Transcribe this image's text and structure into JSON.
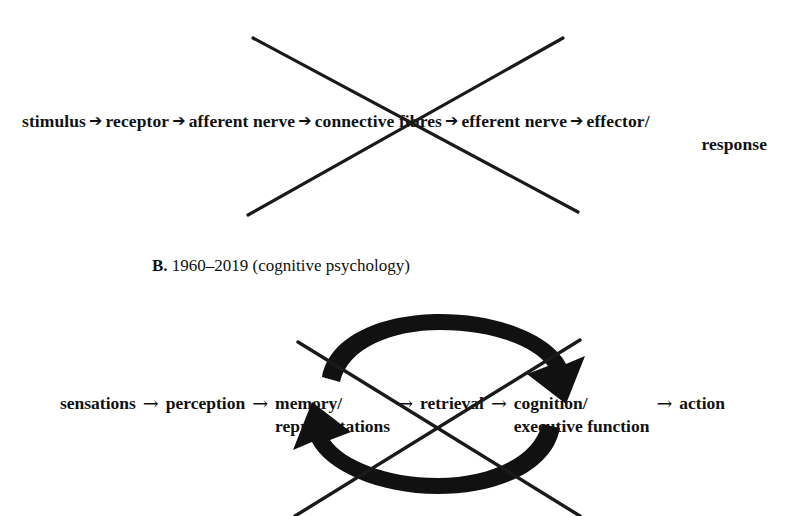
{
  "figure": {
    "background_color": "#ffffff",
    "ink_color": "#111111"
  },
  "panel_a": {
    "terms": [
      "stimulus",
      "receptor",
      "afferent nerve",
      "connective fibres",
      "efferent nerve",
      "effector/"
    ],
    "wrapped_tail": "response",
    "arrow_glyph": "➔",
    "arrow_name": "heavy-right-arrow",
    "strikethrough": {
      "name": "x-strike-cross-out",
      "line1": {
        "x1": 253,
        "y1": 38,
        "x2": 578,
        "y2": 212
      },
      "line2": {
        "x1": 563,
        "y1": 38,
        "x2": 248,
        "y2": 215
      },
      "stroke_width": 3.2,
      "color": "#1a1a1a"
    }
  },
  "panel_b_heading": {
    "letter": "B.",
    "text": "1960–2019 (cognitive psychology)"
  },
  "panel_b": {
    "segments": [
      {
        "main": "sensations",
        "sub": ""
      },
      {
        "main": "perception",
        "sub": ""
      },
      {
        "main": "memory/",
        "sub": "representations"
      },
      {
        "main": "retrieval",
        "sub": ""
      },
      {
        "main": "cognition/",
        "sub": "executive function"
      },
      {
        "main": "action",
        "sub": ""
      }
    ],
    "arrow_glyph": "→",
    "arrow_name": "thin-right-arrow",
    "loop": {
      "name": "circular-feedback-loop",
      "top_arc_label": "forward-sweep-arc-arrow",
      "bottom_arc_label": "feedback-return-arc-arrow",
      "color": "#111111"
    },
    "strikethrough": {
      "name": "x-strike-cross-out",
      "line1": {
        "x1": 298,
        "y1": 42,
        "x2": 580,
        "y2": 216
      },
      "line2": {
        "x1": 580,
        "y1": 40,
        "x2": 295,
        "y2": 216
      },
      "stroke_width": 3.4,
      "color": "#1a1a1a"
    }
  }
}
